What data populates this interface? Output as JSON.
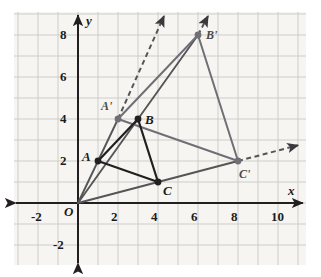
{
  "figure": {
    "type": "coordinate-plane-dilation",
    "background": "#ffffff",
    "plot_bg": "#f6f5f2",
    "grid_color": "#c9c9c4",
    "axis_color": "#231f20",
    "preimage_color": "#231f20",
    "image_color": "#6f6f75",
    "ray_color": "#555558"
  },
  "axes": {
    "x_label": "x",
    "y_label": "y",
    "origin_label": "O",
    "x_ticks": [
      {
        "value": -2,
        "label": "-2"
      },
      {
        "value": 2,
        "label": "2"
      },
      {
        "value": 4,
        "label": "4"
      },
      {
        "value": 6,
        "label": "6"
      },
      {
        "value": 8,
        "label": "8"
      },
      {
        "value": 10,
        "label": "10"
      }
    ],
    "y_ticks": [
      {
        "value": 8,
        "label": "8"
      },
      {
        "value": 6,
        "label": "6"
      },
      {
        "value": 4,
        "label": "4"
      },
      {
        "value": 2,
        "label": "2"
      },
      {
        "value": -2,
        "label": "-2"
      }
    ],
    "x_range": [
      -3.2,
      11.3
    ],
    "y_range": [
      -3.1,
      9.1
    ],
    "grid": true
  },
  "chart_data": {
    "type": "scatter",
    "title": "",
    "xlabel": "x",
    "ylabel": "y",
    "xlim": [
      -3.2,
      11.3
    ],
    "ylim": [
      -3.1,
      9.1
    ],
    "grid": true,
    "points": [
      {
        "name": "O",
        "label": "O",
        "x": 0,
        "y": 0,
        "kind": "origin",
        "marked": false
      },
      {
        "name": "A",
        "label": "A",
        "x": 1,
        "y": 2,
        "kind": "preimage",
        "marked": true
      },
      {
        "name": "B",
        "label": "B",
        "x": 3,
        "y": 4,
        "kind": "preimage",
        "marked": true
      },
      {
        "name": "C",
        "label": "C",
        "x": 4,
        "y": 1,
        "kind": "preimage",
        "marked": true
      },
      {
        "name": "A'",
        "label": "A'",
        "x": 2,
        "y": 4,
        "kind": "image",
        "marked": true
      },
      {
        "name": "B'",
        "label": "B'",
        "x": 6,
        "y": 8,
        "kind": "image",
        "marked": true
      },
      {
        "name": "C'",
        "label": "C'",
        "x": 8,
        "y": 2,
        "kind": "image",
        "marked": true
      }
    ],
    "polygons": [
      {
        "name": "triangle-ABC",
        "vertices": [
          "A",
          "B",
          "C"
        ],
        "style": "solid-dark"
      },
      {
        "name": "triangle-A'B'C'",
        "vertices": [
          "A'",
          "B'",
          "C'"
        ],
        "style": "solid-gray"
      }
    ],
    "rays": [
      {
        "name": "ray-O-A-A'",
        "from": "O",
        "through": "A",
        "to": "A'",
        "extends_dashed": true,
        "dash_end": [
          4.3,
          8.9
        ]
      },
      {
        "name": "ray-O-B-B'",
        "from": "O",
        "through": "B",
        "to": "B'",
        "extends_dashed": true,
        "dash_end": [
          6.5,
          8.9
        ]
      },
      {
        "name": "ray-O-C-C'",
        "from": "O",
        "through": "C",
        "to": "C'",
        "extends_dashed": true,
        "dash_end": [
          11.0,
          2.75
        ]
      }
    ],
    "scale_factor": 2
  },
  "labels": {
    "A": "A",
    "B": "B",
    "C": "C",
    "Aprime": "A'",
    "Bprime": "B'",
    "Cprime": "C'",
    "origin": "O",
    "x": "x",
    "y": "y"
  }
}
